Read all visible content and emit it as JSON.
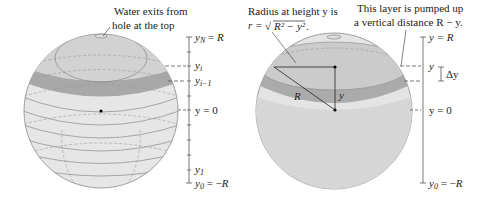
{
  "figure": {
    "left_panel": {
      "annotation_line1": "Water exits from",
      "annotation_line2": "hole at the top",
      "axis_labels": {
        "top": {
          "var": "y",
          "sub": "N",
          "rest": " = R"
        },
        "yi": {
          "var": "y",
          "sub": "i"
        },
        "yi_minus_1": {
          "var": "y",
          "sub": "i−1"
        },
        "zero": {
          "text": "y = 0"
        },
        "y1": {
          "var": "y",
          "sub": "1"
        },
        "bottom": {
          "var": "y",
          "sub": "0",
          "rest": " = −R"
        }
      }
    },
    "right_panel": {
      "annotation_left_line1": "Radius at height y is",
      "annotation_left_line2_prefix": "r = ",
      "annotation_left_line2_formula": "R² − y²",
      "annotation_left_line2_suffix": ".",
      "annotation_right_line1": "This layer is pumped up",
      "annotation_right_line2": "a vertical distance R − y.",
      "radius_label": "R",
      "height_label": "y",
      "axis_labels": {
        "top": "y = R",
        "layer": "y",
        "delta": "Δy",
        "zero": "y = 0",
        "bottom": {
          "var": "y",
          "sub": "0",
          "rest": " = −R"
        }
      }
    },
    "colors": {
      "sphere_fill": "#e4e4e4",
      "water_fill": "#cfcfcf",
      "layer_band": "#a9a9a9",
      "outline": "#8a8a8a",
      "axis": "#555555",
      "text": "#222222"
    }
  }
}
